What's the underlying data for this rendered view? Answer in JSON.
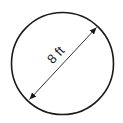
{
  "diagram": {
    "shape": "circle",
    "dimension": {
      "type": "diameter",
      "label": "8 ft",
      "value": 8,
      "unit": "ft"
    },
    "colors": {
      "stroke": "#1a1a1a",
      "background": "#ffffff"
    }
  }
}
